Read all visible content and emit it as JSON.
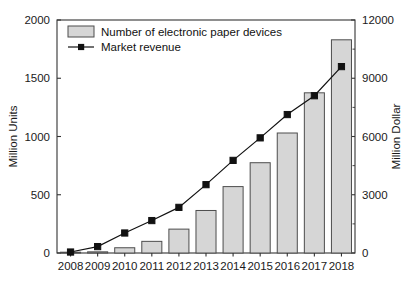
{
  "chart_data": {
    "type": "bar",
    "title": "",
    "subtitle": "",
    "categories": [
      "2008",
      "2009",
      "2010",
      "2011",
      "2012",
      "2013",
      "2014",
      "2015",
      "2016",
      "2017",
      "2018"
    ],
    "xlabel": "",
    "grid": false,
    "legend_position": "top-left",
    "series": [
      {
        "name": "Number of electronic paper devices",
        "type": "bar",
        "axis": "left",
        "unit": "Million Units",
        "color": "#d6d6d6",
        "edge_color": "#4d4d4d",
        "values": [
          2,
          10,
          45,
          100,
          205,
          365,
          570,
          775,
          1030,
          1375,
          1830
        ]
      },
      {
        "name": "Market revenue",
        "type": "line",
        "axis": "right",
        "unit": "Million Dollar",
        "color": "#111111",
        "marker": "square",
        "values": [
          50,
          330,
          1030,
          1670,
          2350,
          3520,
          4770,
          5930,
          7130,
          8100,
          9600
        ]
      }
    ],
    "left_axis": {
      "label": "Million Units",
      "ticks": [
        0,
        500,
        1000,
        1500,
        2000
      ],
      "tick_labels": [
        "0",
        "500",
        "1000",
        "1500",
        "2000"
      ],
      "ylim": [
        0,
        2000
      ]
    },
    "right_axis": {
      "label": "Million Dollar",
      "ticks": [
        0,
        3000,
        6000,
        9000,
        12000
      ],
      "tick_labels": [
        "0",
        "3000",
        "6000",
        "9000",
        "12000"
      ],
      "minor_ticks": [
        1500,
        4500,
        7500,
        10500
      ],
      "ylim": [
        0,
        12000
      ]
    }
  },
  "legend": {
    "items": [
      {
        "label": "Number of electronic paper devices",
        "glyph": "bar-swatch-icon"
      },
      {
        "label": "Market revenue",
        "glyph": "line-marker-icon"
      }
    ]
  },
  "colors": {
    "bar_fill": "#d6d6d6",
    "bar_edge": "#4d4d4d",
    "line": "#111111",
    "axis": "#333333",
    "background": "#ffffff"
  }
}
